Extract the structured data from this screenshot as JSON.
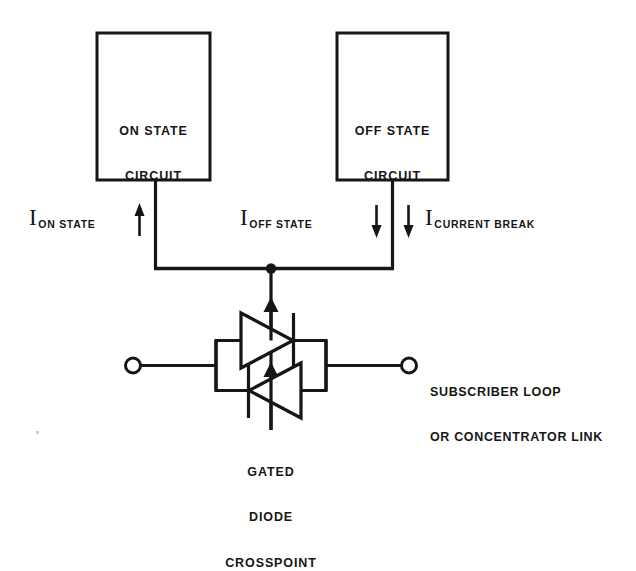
{
  "diagram": {
    "line_color": "#161616",
    "background_color": "#ffffff"
  },
  "blocks": [
    {
      "id": "on-state-circuit",
      "line1": "ON STATE",
      "line2": "CIRCUIT"
    },
    {
      "id": "off-state-circuit",
      "line1": "OFF STATE",
      "line2": "CIRCUIT"
    }
  ],
  "currents": [
    {
      "id": "i-on-state",
      "symbol": "I",
      "subscript": "ON STATE",
      "arrow": "up",
      "arrow_glyph": "↑"
    },
    {
      "id": "i-off-state",
      "symbol": "I",
      "subscript": "OFF STATE",
      "arrow": "down",
      "arrow_glyph": "↓"
    },
    {
      "id": "i-current-break",
      "symbol": "I",
      "subscript": "CURRENT BREAK",
      "arrow": "down",
      "arrow_glyph": "↓"
    }
  ],
  "crosspoint": {
    "caption_line1": "GATED",
    "caption_line2": "DIODE",
    "caption_line3": "CROSSPOINT",
    "top_diode_direction": "right",
    "bottom_diode_direction": "left",
    "gate_arrow_direction": "up"
  },
  "port_label": {
    "line1": "SUBSCRIBER LOOP",
    "line2": "OR CONCENTRATOR LINK"
  },
  "terminals": [
    {
      "id": "left-terminal",
      "type": "open-circle"
    },
    {
      "id": "right-terminal",
      "type": "open-circle"
    }
  ]
}
